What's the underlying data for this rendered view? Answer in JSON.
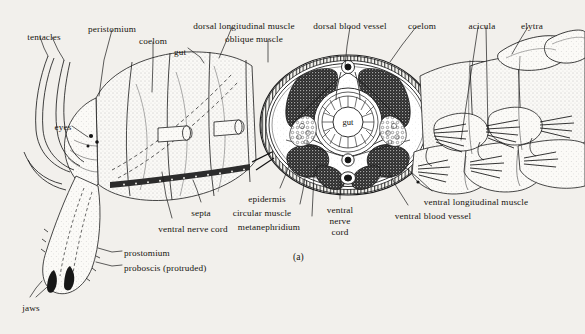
{
  "figure": {
    "caption": "(a)",
    "inner_label_gut": "gut",
    "colors": {
      "paper": "#f2f0ec",
      "ink": "#16140f",
      "line": "#1a1a1a",
      "muscle_dark": "#2b2b2b",
      "tissue_light": "#e8e6e0",
      "stipple": "#6b6b6b"
    }
  },
  "labels": [
    {
      "id": "tentacles",
      "text": "tentacles",
      "x": 44,
      "y": 32,
      "align": "center"
    },
    {
      "id": "peristomium",
      "text": "peristomium",
      "x": 112,
      "y": 24,
      "align": "center"
    },
    {
      "id": "coelom-left",
      "text": "coelom",
      "x": 153,
      "y": 36,
      "align": "center"
    },
    {
      "id": "gut-left",
      "text": "gut",
      "x": 180,
      "y": 47,
      "align": "center"
    },
    {
      "id": "dorsal-longitudinal-muscle",
      "text": "dorsal longitudinal muscle",
      "x": 244,
      "y": 21,
      "align": "center"
    },
    {
      "id": "oblique-muscle",
      "text": "oblique muscle",
      "x": 254,
      "y": 34,
      "align": "center"
    },
    {
      "id": "dorsal-blood-vessel",
      "text": "dorsal blood vessel",
      "x": 350,
      "y": 21,
      "align": "center"
    },
    {
      "id": "coelom-right",
      "text": "coelom",
      "x": 422,
      "y": 21,
      "align": "center"
    },
    {
      "id": "acicula",
      "text": "acicula",
      "x": 482,
      "y": 21,
      "align": "center"
    },
    {
      "id": "elytra",
      "text": "elytra",
      "x": 532,
      "y": 21,
      "align": "center"
    },
    {
      "id": "eyes",
      "text": "eyes",
      "x": 63,
      "y": 122,
      "align": "center"
    },
    {
      "id": "septa",
      "text": "septa",
      "x": 201,
      "y": 208,
      "align": "center"
    },
    {
      "id": "ventral-nerve-cord-left",
      "text": "ventral nerve cord",
      "x": 193,
      "y": 224,
      "align": "center"
    },
    {
      "id": "epidermis",
      "text": "epidermis",
      "x": 267,
      "y": 194,
      "align": "center"
    },
    {
      "id": "circular-muscle",
      "text": "circular muscle",
      "x": 262,
      "y": 208,
      "align": "center"
    },
    {
      "id": "metanephridium",
      "text": "metanephridium",
      "x": 269,
      "y": 222,
      "align": "center"
    },
    {
      "id": "ventral-nerve-cord-a",
      "text": "ventral",
      "x": 340,
      "y": 205,
      "align": "center"
    },
    {
      "id": "ventral-nerve-cord-b",
      "text": "nerve",
      "x": 340,
      "y": 216,
      "align": "center"
    },
    {
      "id": "ventral-nerve-cord-c",
      "text": "cord",
      "x": 340,
      "y": 227,
      "align": "center"
    },
    {
      "id": "ventral-longitudinal-muscle",
      "text": "ventral longitudinal muscle",
      "x": 476,
      "y": 197,
      "align": "center"
    },
    {
      "id": "ventral-blood-vessel",
      "text": "ventral blood vessel",
      "x": 433,
      "y": 211,
      "align": "center"
    },
    {
      "id": "prostomium",
      "text": "prostomium",
      "x": 124,
      "y": 248,
      "align": "left"
    },
    {
      "id": "proboscis-protruded",
      "text": "proboscis (protruded)",
      "x": 124,
      "y": 263,
      "align": "left"
    },
    {
      "id": "jaws",
      "text": "jaws",
      "x": 31,
      "y": 303,
      "align": "center"
    }
  ],
  "leaders": [
    {
      "id": "leader-tentacles",
      "points": "40,37 44,48 48,56"
    },
    {
      "id": "leader-tentacles-2",
      "points": "52,37 58,50 64,60"
    },
    {
      "id": "leader-peristomium",
      "points": "112,30 104,60 99,96"
    },
    {
      "id": "leader-coelom-left",
      "points": "153,42 153,60 152,92"
    },
    {
      "id": "leader-gut-left",
      "points": "188,48 200,57 204,63"
    },
    {
      "id": "leader-dorsal-long",
      "points": "232,27 225,44 219,58"
    },
    {
      "id": "leader-oblique",
      "points": "268,40 268,52 268,62"
    },
    {
      "id": "leader-dorsal-bv",
      "points": "350,27 347,46 345,66"
    },
    {
      "id": "leader-coelom-right",
      "points": "416,27 402,45 390,62"
    },
    {
      "id": "leader-acicula-1",
      "points": "478,27 470,80 461,140"
    },
    {
      "id": "leader-acicula-2",
      "points": "486,27 487,80 488,132"
    },
    {
      "id": "leader-elytra",
      "points": "528,27 520,40 512,54"
    },
    {
      "id": "leader-eyes",
      "points": "72,126 82,133 88,137"
    },
    {
      "id": "leader-septa",
      "points": "201,202 197,190 193,180"
    },
    {
      "id": "leader-vnc-left",
      "points": "172,218 166,196 162,172"
    },
    {
      "id": "leader-epidermis",
      "points": "280,188 285,176 289,166"
    },
    {
      "id": "leader-circ-muscle",
      "points": "300,204 303,190 305,178"
    },
    {
      "id": "leader-metaneph",
      "points": "312,216 313,195 314,174"
    },
    {
      "id": "leader-vnc-mid",
      "points": "340,199 340,186 340,176"
    },
    {
      "id": "leader-v-long-musc",
      "points": "432,191 418,178 406,168"
    },
    {
      "id": "leader-v-blood-ves",
      "points": "408,205 396,186 389,172"
    },
    {
      "id": "leader-prostomium",
      "points": "122,251 112,252 98,248"
    },
    {
      "id": "leader-proboscis",
      "points": "122,265 112,266 96,262"
    },
    {
      "id": "leader-jaws-1",
      "points": "30,297 36,288 42,281"
    },
    {
      "id": "leader-jaws-2",
      "points": "36,297 46,288 53,282"
    }
  ]
}
